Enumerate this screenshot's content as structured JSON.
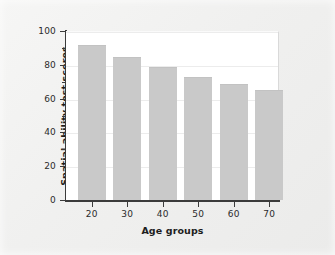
{
  "chart_data": {
    "type": "bar",
    "title": "",
    "subtitle": "",
    "xlabel": "Age groups",
    "ylabel": "Spatial ability test scores",
    "categories": [
      "20",
      "30",
      "40",
      "50",
      "60",
      "70"
    ],
    "values": [
      92,
      84.5,
      79,
      73,
      68.5,
      65
    ],
    "series": [
      {
        "name": "Spatial ability test scores",
        "values": [
          92,
          84.5,
          79,
          73,
          68.5,
          65
        ]
      }
    ],
    "ylim": [
      0,
      100
    ],
    "ytick_labels": [
      "0",
      "20",
      "40",
      "60",
      "80",
      "100"
    ],
    "ytick_values": [
      0,
      20,
      40,
      60,
      80,
      100
    ],
    "yminor_tick_values": [
      10,
      30,
      50,
      70,
      90
    ],
    "xtick_labels": [
      "20",
      "30",
      "40",
      "50",
      "60",
      "70"
    ],
    "grid": "horizontal",
    "legend": "none",
    "annotations": [],
    "colors": {
      "bar_fill": "#c9c9c9",
      "axis_line": "#3b3b3b",
      "gridline": "#ececec",
      "plot_background": "#ffffff",
      "figure_background": "#f2f2f1",
      "text": "#1d1d1d"
    }
  }
}
